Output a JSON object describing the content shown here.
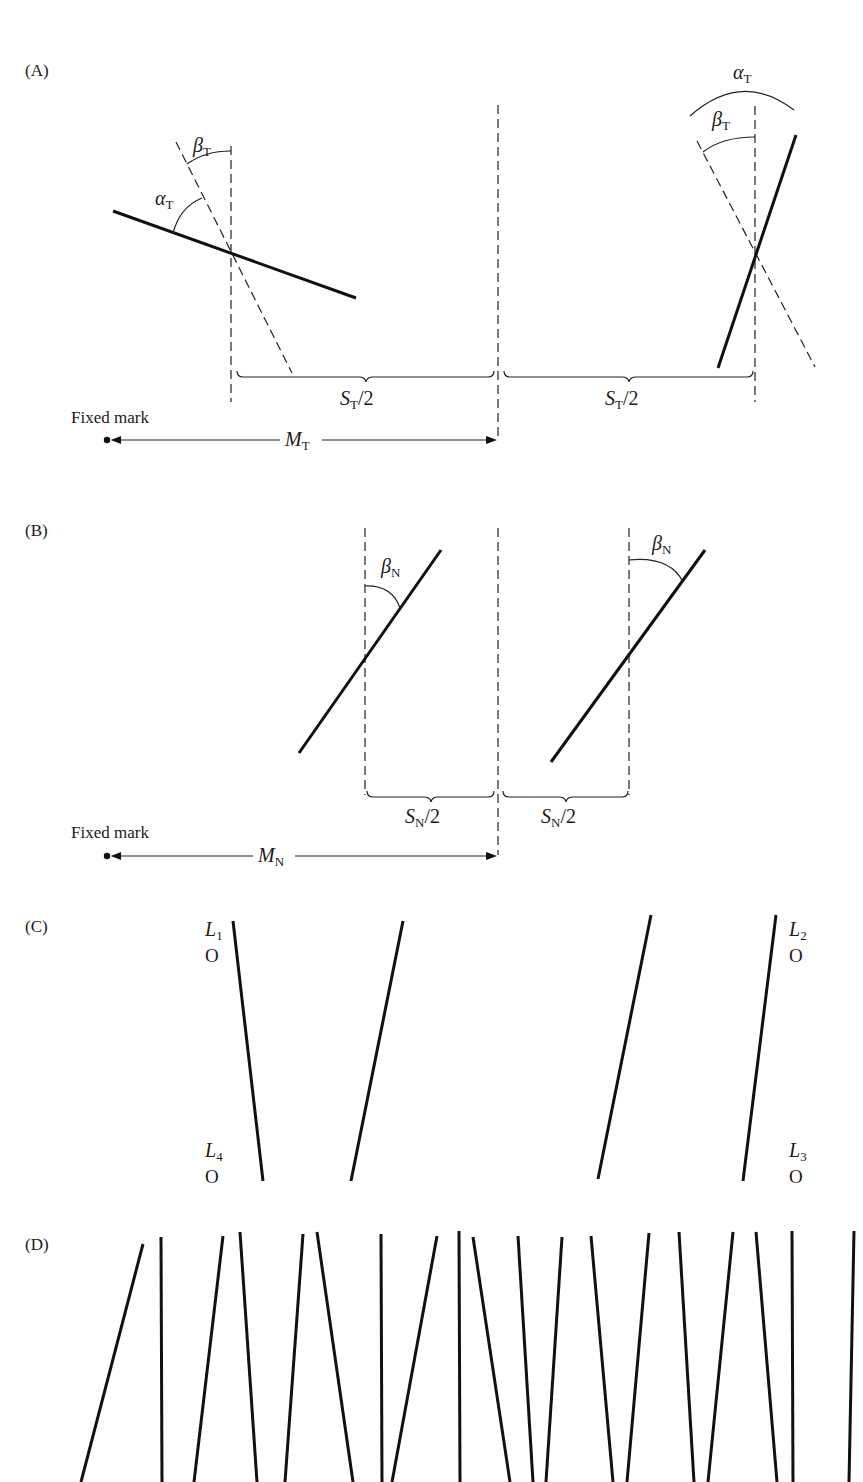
{
  "figure": {
    "panels": {
      "A": {
        "label": "(A)",
        "alpha_left": {
          "sym": "α",
          "sub": "T"
        },
        "beta_left": {
          "sym": "β",
          "sub": "T"
        },
        "alpha_right": {
          "sym": "α",
          "sub": "T"
        },
        "beta_right": {
          "sym": "β",
          "sub": "T"
        },
        "brace_left": {
          "sym": "S",
          "sub": "T",
          "suffix": "/2"
        },
        "brace_right": {
          "sym": "S",
          "sub": "T",
          "suffix": "/2"
        },
        "fixed_mark": "Fixed mark",
        "distance": {
          "sym": "M",
          "sub": "T"
        }
      },
      "B": {
        "label": "(B)",
        "beta_left": {
          "sym": "β",
          "sub": "N"
        },
        "beta_right": {
          "sym": "β",
          "sub": "N"
        },
        "brace_left": {
          "sym": "S",
          "sub": "N",
          "suffix": "/2"
        },
        "brace_right": {
          "sym": "S",
          "sub": "N",
          "suffix": "/2"
        },
        "fixed_mark": "Fixed mark",
        "distance": {
          "sym": "M",
          "sub": "N"
        }
      },
      "C": {
        "label": "(C)",
        "lights": [
          {
            "sym": "L",
            "sub": "1",
            "marker": "O"
          },
          {
            "sym": "L",
            "sub": "2",
            "marker": "O"
          },
          {
            "sym": "L",
            "sub": "3",
            "marker": "O"
          },
          {
            "sym": "L",
            "sub": "4",
            "marker": "O"
          }
        ]
      },
      "D": {
        "label": "(D)",
        "line_count": 19
      }
    },
    "colors": {
      "ink": "#111111",
      "background": "#ffffff"
    }
  }
}
